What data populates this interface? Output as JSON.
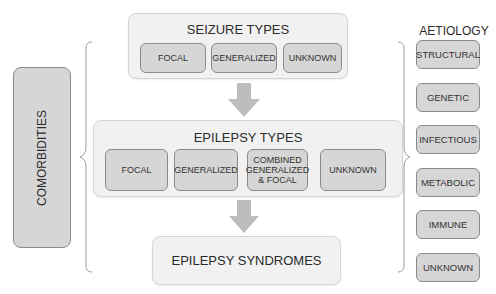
{
  "seizure_types": {
    "title": "SEIZURE TYPES",
    "items": [
      "FOCAL",
      "GENERALIZED",
      "UNKNOWN"
    ]
  },
  "epilepsy_types": {
    "title": "EPILEPSY TYPES",
    "items": [
      "FOCAL",
      "GENERALIZED",
      "COMBINED\nGENERALIZED\n& FOCAL",
      "UNKNOWN"
    ],
    "combined_lines": [
      "COMBINED",
      "GENERALIZED",
      "& FOCAL"
    ]
  },
  "epilepsy_syndromes": {
    "title": "EPILEPSY SYNDROMES"
  },
  "comorbidities": {
    "label": "COMORBIDITIES"
  },
  "aetiology": {
    "title": "AETIOLOGY",
    "items": [
      "STRUCTURAL",
      "GENETIC",
      "INFECTIOUS",
      "METABOLIC",
      "IMMUNE",
      "UNKNOWN"
    ]
  },
  "colors": {
    "container_bg": "#f1f1f1",
    "box_bg": "#d6d6d6",
    "box_border": "#8a8a8a",
    "arrow": "#bdbdbd",
    "brace": "#9a9a9a"
  }
}
